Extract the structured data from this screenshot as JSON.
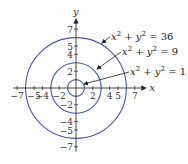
{
  "diagram": {
    "type": "concentric-circles",
    "center": {
      "x": 0,
      "y": 0
    },
    "axes": {
      "x_label": "x",
      "y_label": "y",
      "x_ticks": [
        {
          "value": -7,
          "label": "−7"
        },
        {
          "value": -5,
          "label": "−5"
        },
        {
          "value": -4,
          "label": "−4"
        },
        {
          "value": -2,
          "label": "−2"
        },
        {
          "value": 2,
          "label": "2"
        },
        {
          "value": 4,
          "label": "4"
        },
        {
          "value": 5,
          "label": "5"
        },
        {
          "value": 7,
          "label": "7"
        }
      ],
      "y_ticks": [
        {
          "value": 7,
          "label": "7"
        },
        {
          "value": 5,
          "label": "5"
        },
        {
          "value": 4,
          "label": "4"
        },
        {
          "value": 2,
          "label": "2"
        },
        {
          "value": -2,
          "label": "−2"
        },
        {
          "value": -4,
          "label": "−4"
        },
        {
          "value": -5,
          "label": "−5"
        },
        {
          "value": -7,
          "label": "−7"
        }
      ]
    },
    "circles": [
      {
        "equation": "x² + y² = 36",
        "radius": 6,
        "rhs": "36"
      },
      {
        "equation": "x² + y² = 9",
        "radius": 3,
        "rhs": "9"
      },
      {
        "equation": "x² + y² = 1",
        "radius": 1,
        "rhs": "1"
      }
    ],
    "colors": {
      "circle": "#4a5a9c",
      "axis": "#333333",
      "arrow": "#222222",
      "text": "#222222"
    }
  }
}
